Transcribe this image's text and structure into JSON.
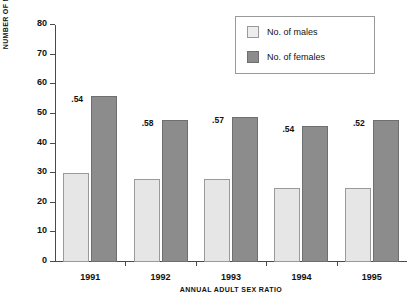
{
  "chart_data": {
    "type": "bar",
    "title": "",
    "xlabel": "ANNUAL ADULT SEX RATIO",
    "ylabel": "NUMBER OF MALES AND FEMALES",
    "categories": [
      "1991",
      "1992",
      "1993",
      "1994",
      "1995"
    ],
    "series": [
      {
        "name": "No. of males",
        "color": "#e6e6e6",
        "values": [
          30,
          28,
          28,
          25,
          25
        ]
      },
      {
        "name": "No. of females",
        "color": "#8c8c8c",
        "values": [
          56,
          48,
          49,
          46,
          48
        ]
      }
    ],
    "annotations": [
      ".54",
      ".58",
      ".57",
      ".54",
      ".52"
    ],
    "ylim": [
      0,
      80
    ],
    "yticks": [
      "0",
      "10",
      "20",
      "30",
      "40",
      "50",
      "60",
      "70",
      "80"
    ],
    "grid": false,
    "legend_position": "top-right"
  },
  "legend": {
    "items": [
      {
        "label": "No. of males"
      },
      {
        "label": "No. of females"
      }
    ]
  },
  "axes": {
    "y_title": "NUMBER OF MALES AND FEMALES",
    "x_title": "ANNUAL ADULT SEX RATIO"
  }
}
